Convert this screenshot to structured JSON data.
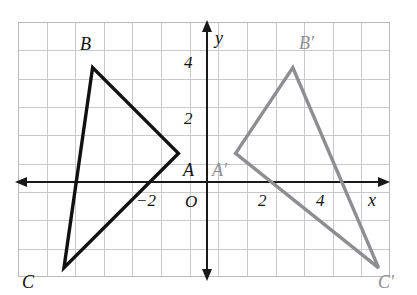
{
  "figure": {
    "background_color": "#ffffff",
    "grid": {
      "border_color": "#b8b8bd",
      "line_color": "#c9c9cd",
      "columns": 13,
      "rows": 9,
      "cell_px": 28.6,
      "left_px": 18,
      "top_px": 22,
      "right_px": 390,
      "bottom_px": 277
    },
    "axes": {
      "color": "#191919",
      "origin_px": {
        "x": 207,
        "y": 182
      },
      "unit_px": 28.6,
      "x_axis_label": "x",
      "y_axis_label": "y",
      "origin_label": "O",
      "x_ticks": [
        {
          "value": -2,
          "label": "−2"
        },
        {
          "value": 2,
          "label": "2"
        },
        {
          "value": 4,
          "label": "4"
        }
      ],
      "y_ticks": [
        {
          "value": 2,
          "label": "2"
        },
        {
          "value": 4,
          "label": "4"
        }
      ]
    }
  },
  "chart_data": {
    "type": "scatter",
    "xlabel": "x",
    "ylabel": "y",
    "xlim": [
      -6.6,
      6.4
    ],
    "ylim": [
      -3.65,
      5.35
    ],
    "grid": true,
    "legend": "none",
    "series": [
      {
        "name": "Triangle ABC",
        "color": "#111111",
        "closed": true,
        "points": [
          {
            "label": "A",
            "x": -1,
            "y": 1
          },
          {
            "label": "B",
            "x": -4,
            "y": 4
          },
          {
            "label": "C",
            "x": -5,
            "y": -3
          }
        ]
      },
      {
        "name": "Triangle A'B'C'",
        "color": "#8e8e92",
        "closed": true,
        "points": [
          {
            "label": "B'",
            "x": 3,
            "y": 4
          },
          {
            "label": "A'",
            "x": 1,
            "y": 1
          },
          {
            "label": "C'",
            "x": 6,
            "y": -3
          }
        ]
      }
    ],
    "annotations": [
      {
        "text": "B",
        "x": -4.35,
        "y": 4.55,
        "color": "#111111",
        "italic": true
      },
      {
        "text": "C",
        "x": -5.5,
        "y": -3.55,
        "color": "#111111",
        "italic": true
      },
      {
        "text": "A",
        "x": -0.85,
        "y": 0.62,
        "color": "#111111",
        "italic": true
      },
      {
        "text": "B′",
        "x": 3.25,
        "y": 4.5,
        "color": "#8e8e92",
        "italic": true
      },
      {
        "text": "A′",
        "x": 0.25,
        "y": 0.62,
        "color": "#8e8e92",
        "italic": true
      },
      {
        "text": "C′",
        "x": 6.05,
        "y": -3.5,
        "color": "#8e8e92",
        "italic": true
      }
    ]
  },
  "labels": {
    "vertex_b": "B",
    "vertex_c": "C",
    "vertex_a": "A",
    "vertex_b_prime": "B′",
    "vertex_a_prime": "A′",
    "vertex_c_prime": "C′",
    "origin": "O",
    "axis_x": "x",
    "axis_y": "y",
    "tick_x_neg2": "−2",
    "tick_x_2": "2",
    "tick_x_4": "4",
    "tick_y_2": "2",
    "tick_y_4": "4"
  }
}
